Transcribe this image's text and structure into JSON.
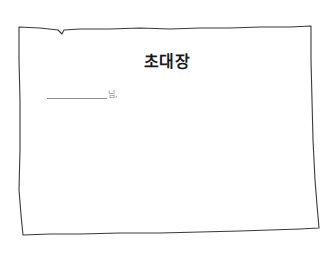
{
  "invitation": {
    "title": "초대장",
    "recipient": {
      "name_value": "",
      "suffix": "님,"
    }
  },
  "colors": {
    "background": "#ffffff",
    "border": "#3a3a3a",
    "title_text": "#1a1a1a",
    "line": "#8a8a8a"
  }
}
